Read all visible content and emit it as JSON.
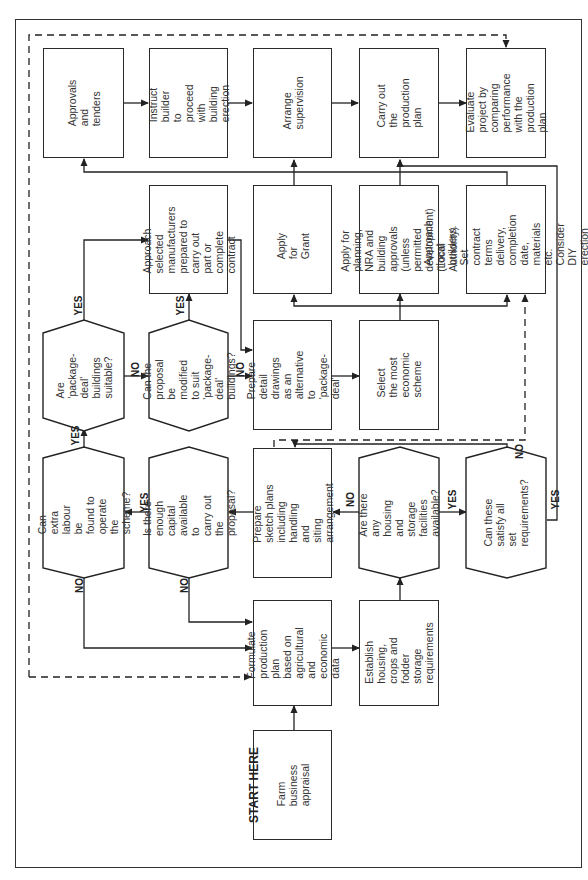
{
  "diagram": {
    "orientation": "rotated 90 degrees counter-clockwise",
    "start_label": "START HERE",
    "nodes": {
      "farm_appraisal": "Farm business\nappraisal",
      "formulate_plan": "Formulate production\nplan based on\nagricultural and\neconomic data",
      "establish_requirements": "Establish housing,\ncrops and fodder\nstorage requirements",
      "housing_available": "Are there any\nhousing and storage\nfacilities available?",
      "satisfy_requirements": "Can these satisfy all\nset requirements?",
      "sketch_plans": "Prepare sketch plans\nincluding handling and\nsiting arrangement",
      "enough_capital": "Is there enough\ncapital available to\ncarry out the\nproposal?",
      "extra_labour": "Can extra labour be\nfound to operate the\nscheme?",
      "package_suitable": "Are 'package-deal'\nbuildings suitable?",
      "modify_proposal": "Can the proposal\nbe modified to suit\n'package-deal'\nbuildings?",
      "approach_manufacturers": "Approach selected\nmanufacturers\nprepared to carry out\npart or complete\ncontract",
      "detail_drawings": "Prepare detail\ndrawings as an\nalternative to\n'package-deal'",
      "select_scheme": "Select the most\neconomic scheme",
      "apply_grant": "Apply for Grant",
      "apply_planning": "Apply for planning,\nNRA and building\napprovals (unless\npermitted\ndevelopment)\n(Local Authority)",
      "approach_builders": "Approach local\nbuilders. Set contract\nterms delivery,\ncompletion date,\nmaterials etc. Consider\nDIY erection",
      "approvals_tenders": "Approvals and tenders",
      "instruct_builder": "Instruct builder to\nproceed with building\nerection",
      "arrange_supervision": "Arrange supervision",
      "carry_out_plan": "Carry out the\nproduction plan",
      "evaluate_project": "Evaluate project by\ncomparing\nperformance with the\nproduction plan"
    },
    "edge_labels": {
      "yes": "YES",
      "no": "NO"
    },
    "edges": [
      {
        "from": "farm_appraisal",
        "to": "formulate_plan"
      },
      {
        "from": "formulate_plan",
        "to": "establish_requirements"
      },
      {
        "from": "establish_requirements",
        "to": "housing_available"
      },
      {
        "from": "housing_available",
        "to": "satisfy_requirements",
        "label": "YES"
      },
      {
        "from": "housing_available",
        "to": "sketch_plans",
        "label": "NO"
      },
      {
        "from": "satisfy_requirements",
        "to": "sketch_plans",
        "label": "NO"
      },
      {
        "from": "satisfy_requirements",
        "to": "carry_out_plan",
        "label": "YES"
      },
      {
        "from": "sketch_plans",
        "to": "enough_capital"
      },
      {
        "from": "enough_capital",
        "to": "extra_labour",
        "label": "YES"
      },
      {
        "from": "enough_capital",
        "to": "formulate_plan",
        "label": "NO"
      },
      {
        "from": "extra_labour",
        "to": "package_suitable",
        "label": "YES"
      },
      {
        "from": "extra_labour",
        "to": "formulate_plan",
        "label": "NO"
      },
      {
        "from": "package_suitable",
        "to": "approach_manufacturers",
        "label": "YES"
      },
      {
        "from": "package_suitable",
        "to": "modify_proposal",
        "label": "NO"
      },
      {
        "from": "modify_proposal",
        "to": "approach_manufacturers",
        "label": "YES"
      },
      {
        "from": "modify_proposal",
        "to": "detail_drawings",
        "label": "NO"
      },
      {
        "from": "approach_manufacturers",
        "to": "detail_drawings"
      },
      {
        "from": "detail_drawings",
        "to": "select_scheme"
      },
      {
        "from": "select_scheme",
        "to": "apply_grant"
      },
      {
        "from": "select_scheme",
        "to": "apply_planning"
      },
      {
        "from": "select_scheme",
        "to": "approach_builders"
      },
      {
        "from": "apply_grant",
        "to": "approvals_tenders"
      },
      {
        "from": "apply_planning",
        "to": "approvals_tenders"
      },
      {
        "from": "approach_builders",
        "to": "approvals_tenders"
      },
      {
        "from": "approvals_tenders",
        "to": "instruct_builder"
      },
      {
        "from": "instruct_builder",
        "to": "arrange_supervision"
      },
      {
        "from": "arrange_supervision",
        "to": "carry_out_plan"
      },
      {
        "from": "carry_out_plan",
        "to": "evaluate_project"
      },
      {
        "from": "evaluate_project",
        "to": "formulate_plan",
        "style": "dashed"
      },
      {
        "from": "sketch_plans",
        "to": "approach_builders",
        "style": "dashed"
      }
    ]
  }
}
